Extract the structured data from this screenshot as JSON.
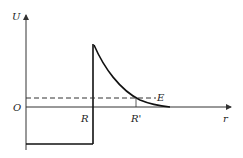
{
  "diagram": {
    "axes": {
      "y_label": "U",
      "x_label": "r",
      "origin_label": "O"
    },
    "markers": {
      "R": "R",
      "R_prime": "R'",
      "energy": "E"
    },
    "colors": {
      "line": "#111111",
      "axis": "#333333",
      "dashed": "#333333"
    }
  }
}
